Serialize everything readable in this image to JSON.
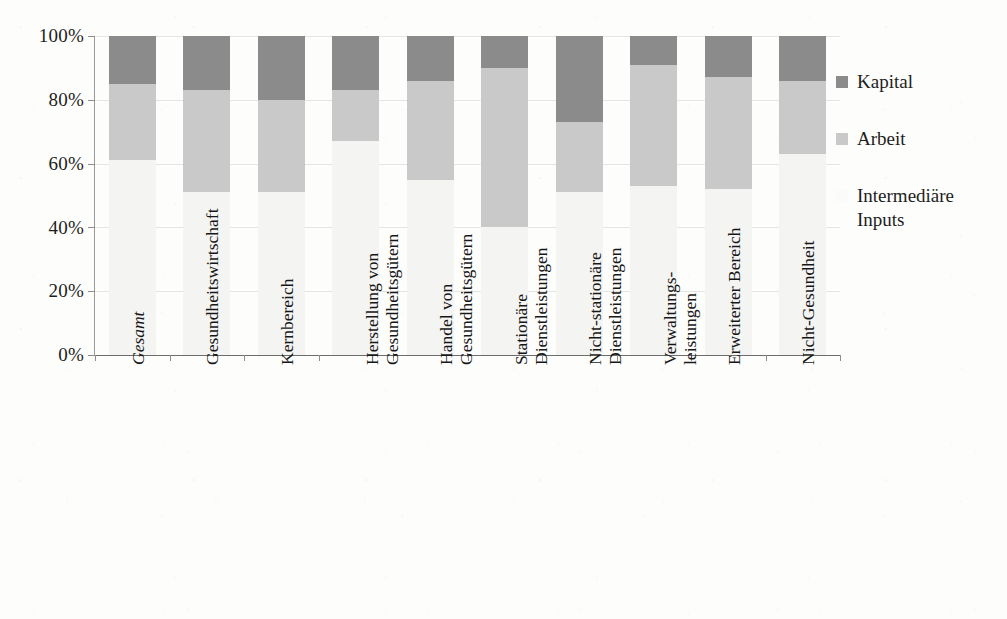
{
  "chart_data": {
    "type": "bar",
    "subtype": "stacked-100-percent",
    "title": "",
    "xlabel": "",
    "ylabel": "",
    "ylim": [
      0,
      100
    ],
    "ytick_labels": [
      "0%",
      "20%",
      "40%",
      "60%",
      "80%",
      "100%"
    ],
    "ytick_values": [
      0,
      20,
      40,
      60,
      80,
      100
    ],
    "grid": true,
    "legend_position": "right",
    "categories": [
      "Gesamt",
      "Gesundheitswirtschaft",
      "Kernbereich",
      "Herstellung von Gesundheitsgütern",
      "Handel von Gesundheitsgütern",
      "Stationäre Dienstleistungen",
      "Nicht-stationäre Dienstleistungen",
      "Verwaltungsleistungen",
      "Erweiterter Bereich",
      "Nicht-Gesundheit"
    ],
    "category_lines": [
      [
        "Gesamt"
      ],
      [
        "Gesundheitswirtschaft"
      ],
      [
        "Kernbereich"
      ],
      [
        "Herstellung von",
        "Gesundheitsgütern"
      ],
      [
        "Handel von",
        "Gesundheitsgütern"
      ],
      [
        "Stationäre",
        "Dienstleistungen"
      ],
      [
        "Nicht-stationäre",
        "Dienstleistungen"
      ],
      [
        "Verwaltungs-",
        "leistungen"
      ],
      [
        "Erweiterter Bereich"
      ],
      [
        "Nicht-Gesundheit"
      ]
    ],
    "category_italic": [
      true,
      false,
      false,
      false,
      false,
      false,
      false,
      false,
      false,
      false
    ],
    "series": [
      {
        "name": "Intermediäre Inputs",
        "color": "#f4f4f3",
        "values": [
          61,
          51,
          51,
          67,
          55,
          40,
          51,
          53,
          52,
          63
        ]
      },
      {
        "name": "Arbeit",
        "color": "#c9c9c9",
        "values": [
          24,
          32,
          29,
          16,
          31,
          50,
          22,
          38,
          35,
          23
        ]
      },
      {
        "name": "Kapital",
        "color": "#8b8b8b",
        "values": [
          15,
          17,
          20,
          17,
          14,
          10,
          27,
          9,
          13,
          14
        ]
      }
    ]
  },
  "legend": {
    "items": [
      {
        "label": "Kapital",
        "color": "#8b8b8b",
        "swatch_class": "kapital"
      },
      {
        "label": "Arbeit",
        "color": "#c9c9c9",
        "swatch_class": "arbeit"
      },
      {
        "label_line1": "Intermediäre",
        "label_line2": "Inputs",
        "color": "#f4f4f3",
        "swatch_class": "inter"
      }
    ]
  },
  "axis": {
    "y": {
      "ticks": [
        "100%",
        "80%",
        "60%",
        "40%",
        "20%",
        "0%"
      ]
    }
  }
}
